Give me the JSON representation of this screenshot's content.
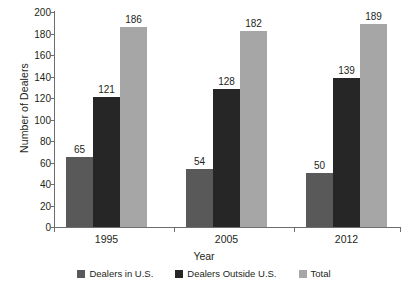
{
  "chart_data": {
    "type": "bar",
    "title": "",
    "xlabel": "Year",
    "ylabel": "Number of Dealers",
    "categories": [
      "1995",
      "2005",
      "2012"
    ],
    "series": [
      {
        "name": "Dealers in U.S.",
        "color": "#595959",
        "values": [
          65,
          54,
          50
        ]
      },
      {
        "name": "Dealers Outside U.S.",
        "color": "#262626",
        "values": [
          121,
          128,
          139
        ]
      },
      {
        "name": "Total",
        "color": "#a6a6a6",
        "values": [
          186,
          182,
          189
        ]
      }
    ],
    "ylim": [
      0,
      200
    ],
    "yticks": [
      0,
      20,
      40,
      60,
      80,
      100,
      120,
      140,
      160,
      180,
      200
    ],
    "grid": false,
    "legend_position": "bottom",
    "data_labels": true
  },
  "axis": {
    "y_title": "Number of Dealers",
    "x_title": "Year",
    "y_tick_labels": [
      "200",
      "180",
      "160",
      "140",
      "120",
      "100",
      "80",
      "60",
      "40",
      "20",
      "0"
    ]
  },
  "legend": {
    "items": [
      {
        "label": "Dealers in U.S."
      },
      {
        "label": "Dealers Outside U.S."
      },
      {
        "label": "Total"
      }
    ]
  },
  "categories": [
    {
      "label": "1995"
    },
    {
      "label": "2005"
    },
    {
      "label": "2012"
    }
  ],
  "labels": {
    "g0s0": "65",
    "g0s1": "121",
    "g0s2": "186",
    "g1s0": "54",
    "g1s1": "128",
    "g1s2": "182",
    "g2s0": "50",
    "g2s1": "139",
    "g2s2": "189"
  }
}
